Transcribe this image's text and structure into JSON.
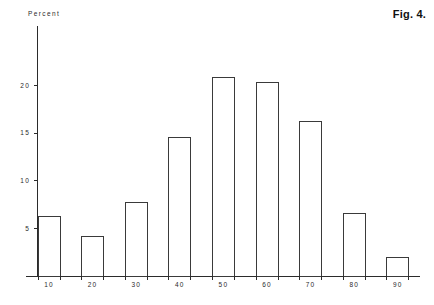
{
  "figure": {
    "caption": "Fig. 4.",
    "axis_title": "Percent"
  },
  "chart_data": {
    "type": "bar",
    "title": "",
    "subtitle": "",
    "xlabel": "",
    "ylabel": "Percent",
    "categories": [
      "10",
      "20",
      "30",
      "40",
      "50",
      "60",
      "70",
      "80",
      "90"
    ],
    "values": [
      6.2,
      4.1,
      7.7,
      14.5,
      20.8,
      20.3,
      16.2,
      6.6,
      1.9
    ],
    "series": [
      {
        "name": "Percent",
        "values": [
          6.2,
          4.1,
          7.7,
          14.5,
          20.8,
          20.3,
          16.2,
          6.6,
          1.9
        ]
      }
    ],
    "ylim": [
      0,
      24
    ],
    "yticks": [
      5,
      10,
      15,
      20
    ],
    "ytick_labels": [
      "5",
      "10",
      "15",
      "20"
    ],
    "xtick_labels": [
      "10",
      "20",
      "30",
      "40",
      "50",
      "60",
      "70",
      "80",
      "90"
    ],
    "grid": false,
    "legend": false,
    "legend_position": "none",
    "bar_style": "outline",
    "annotations": [
      "Fig. 4."
    ]
  },
  "colors": {
    "bar_stroke": "#3a3a3a",
    "bar_fill": "#ffffff",
    "axis": "#2b2b2b",
    "text": "#2a2a2a",
    "caption": "#111111",
    "background": "#ffffff"
  }
}
